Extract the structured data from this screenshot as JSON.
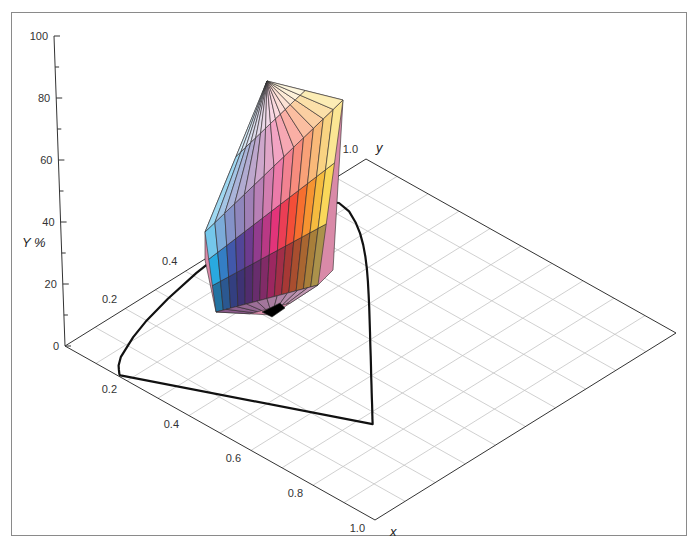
{
  "chart_data": {
    "type": "3d-surface",
    "title": "",
    "axes": {
      "x": {
        "label": "x",
        "range": [
          0,
          1.0
        ],
        "ticks": [
          "0.2",
          "0.4",
          "0.6",
          "0.8",
          "1.0"
        ],
        "tick_values": [
          0.2,
          0.4,
          0.6,
          0.8,
          1.0
        ]
      },
      "y": {
        "label": "y",
        "range": [
          0,
          1.0
        ],
        "ticks": [
          "0.2",
          "0.4",
          "1.0"
        ],
        "tick_values": [
          0.2,
          0.4,
          1.0
        ]
      },
      "Y": {
        "label": "Y %",
        "range": [
          0,
          100
        ],
        "ticks": [
          "0",
          "20",
          "40",
          "60",
          "80",
          "100"
        ],
        "tick_values": [
          0,
          20,
          40,
          60,
          80,
          100
        ]
      }
    },
    "grid": {
      "on": true,
      "step": 0.1
    },
    "spectral_locus_xy": [
      [
        0.1741,
        0.005
      ],
      [
        0.174,
        0.005
      ],
      [
        0.1738,
        0.0049
      ],
      [
        0.1733,
        0.0048
      ],
      [
        0.1726,
        0.0048
      ],
      [
        0.1714,
        0.0051
      ],
      [
        0.1689,
        0.0069
      ],
      [
        0.1644,
        0.0109
      ],
      [
        0.1566,
        0.0177
      ],
      [
        0.144,
        0.0297
      ],
      [
        0.1241,
        0.0578
      ],
      [
        0.0913,
        0.1327
      ],
      [
        0.0687,
        0.2007
      ],
      [
        0.0454,
        0.295
      ],
      [
        0.0235,
        0.4127
      ],
      [
        0.0082,
        0.5384
      ],
      [
        0.0039,
        0.6548
      ],
      [
        0.0139,
        0.7502
      ],
      [
        0.0389,
        0.812
      ],
      [
        0.0743,
        0.8338
      ],
      [
        0.1142,
        0.8262
      ],
      [
        0.1547,
        0.8059
      ],
      [
        0.1929,
        0.7816
      ],
      [
        0.2296,
        0.7543
      ],
      [
        0.2658,
        0.7243
      ],
      [
        0.3016,
        0.6923
      ],
      [
        0.3373,
        0.6589
      ],
      [
        0.3731,
        0.6245
      ],
      [
        0.4087,
        0.5896
      ],
      [
        0.4441,
        0.5547
      ],
      [
        0.4788,
        0.5202
      ],
      [
        0.5125,
        0.4866
      ],
      [
        0.5448,
        0.4544
      ],
      [
        0.5752,
        0.4242
      ],
      [
        0.6029,
        0.3965
      ],
      [
        0.627,
        0.3725
      ],
      [
        0.6482,
        0.3514
      ],
      [
        0.6658,
        0.334
      ],
      [
        0.6801,
        0.3197
      ],
      [
        0.6915,
        0.3083
      ],
      [
        0.7006,
        0.2993
      ],
      [
        0.7079,
        0.292
      ],
      [
        0.714,
        0.2859
      ],
      [
        0.719,
        0.2809
      ],
      [
        0.723,
        0.277
      ],
      [
        0.726,
        0.274
      ],
      [
        0.7283,
        0.2717
      ],
      [
        0.73,
        0.27
      ],
      [
        0.7311,
        0.2689
      ],
      [
        0.732,
        0.268
      ],
      [
        0.7327,
        0.2673
      ],
      [
        0.7334,
        0.2666
      ],
      [
        0.734,
        0.266
      ],
      [
        0.7344,
        0.2656
      ],
      [
        0.7346,
        0.2654
      ],
      [
        0.7347,
        0.2653
      ]
    ],
    "solid": {
      "apex_label": "white",
      "base_label": "black",
      "hue_colors": [
        "#29a9e0",
        "#3d5db0",
        "#5a3b8f",
        "#9b3c8e",
        "#e2347a",
        "#f2463a",
        "#f7802a",
        "#f5c542",
        "#fff27a",
        "#ffffff"
      ]
    }
  },
  "projection": {
    "origin": [
      65,
      346
    ],
    "x_unit": [
      310,
      174
    ],
    "y_unit": [
      301,
      -187
    ],
    "Y_100": [
      -11,
      -310
    ]
  },
  "labels": {
    "Y_axis_title": "Y %",
    "x_axis_title": "x",
    "y_axis_title": "y"
  },
  "colors": {
    "grid": "#c4c4c4",
    "edge": "#333333",
    "locus": "#111111",
    "frame": "#8a8a8a"
  }
}
